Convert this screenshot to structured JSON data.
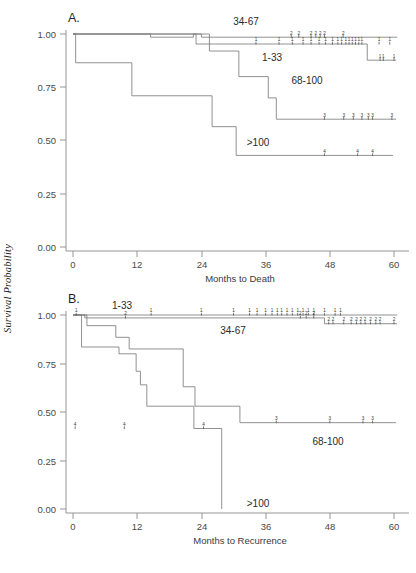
{
  "figure": {
    "ylabel": "Survival Probability",
    "background": "#ffffff",
    "curve_color": "#7d7d7d",
    "axis_color": "#8a8a8a",
    "text_color": "#333333"
  },
  "panels": [
    {
      "letter": "A.",
      "xlabel": "Months to Death",
      "ylabel": "Survival Probability",
      "xticks": [
        "0",
        "12",
        "24",
        "36",
        "48",
        "60"
      ],
      "yticks": [
        "1.00",
        "0.75",
        "0.50",
        "0.25",
        "0.00"
      ],
      "labels": [
        {
          "text": "34-67",
          "x": 246,
          "y": 21
        },
        {
          "text": "1-33",
          "x": 270,
          "y": 57
        },
        {
          "text": "68-100",
          "x": 303,
          "y": 80
        },
        {
          "text": ">100",
          "x": 256,
          "y": 142
        }
      ]
    },
    {
      "letter": "B.",
      "xlabel": "Months to Recurrence",
      "ylabel": "Survival Probability",
      "xticks": [
        "0",
        "12",
        "24",
        "36",
        "48",
        "60"
      ],
      "yticks": [
        "1.00",
        "0.75",
        "0.50",
        "0.25",
        "0.00"
      ],
      "labels": [
        {
          "text": "1-33",
          "x": 120,
          "y": 305
        },
        {
          "text": "34-67",
          "x": 231,
          "y": 330
        },
        {
          "text": "68-100",
          "x": 326,
          "y": 441
        },
        {
          "text": ">100",
          "x": 256,
          "y": 503
        }
      ]
    }
  ],
  "chart_data": {
    "type": "line",
    "subtype": "kaplan-meier-survival",
    "title": "",
    "ylabel": "Survival Probability",
    "ylim": [
      0.0,
      1.0
    ],
    "xlim": [
      0,
      61
    ],
    "grid": false,
    "legend": "inline-curve-labels",
    "panels": [
      {
        "label": "A.",
        "xlabel": "Months to Death",
        "xlim": [
          0,
          61
        ],
        "xticks": [
          0,
          12,
          24,
          36,
          48,
          60
        ],
        "yticks": [
          0.0,
          0.25,
          0.5,
          0.75,
          1.0
        ],
        "series": [
          {
            "name": "1-33",
            "group_code": "1",
            "steps": [
              [
                0,
                1.0
              ],
              [
                23.0,
                1.0
              ],
              [
                23.0,
                0.953
              ],
              [
                55.0,
                0.953
              ],
              [
                55.0,
                0.877
              ],
              [
                60.4,
                0.877
              ]
            ],
            "censor_times": [
              34.2,
              38.5,
              41.0,
              43.0,
              44.5,
              46.0,
              47.2,
              48.5,
              49.5,
              50.2,
              51.0,
              51.6,
              52.2,
              52.8,
              53.4,
              54.0,
              57.2,
              59.2
            ],
            "censor_level": 0.953,
            "censor_times_after": [
              57.4,
              58.0,
              60.0
            ],
            "censor_level_after": 0.877
          },
          {
            "name": "34-67",
            "group_code": "2",
            "steps": [
              [
                0,
                1.0
              ],
              [
                14.5,
                1.0
              ],
              [
                14.5,
                0.985
              ],
              [
                22.5,
                0.985
              ],
              [
                22.5,
                1.0
              ],
              [
                24.0,
                1.0
              ],
              [
                24.0,
                0.985
              ],
              [
                60.6,
                0.985
              ]
            ],
            "censor_times": [
              40.8,
              42.2,
              44.5,
              45.4,
              46.2,
              47.0,
              50.5
            ],
            "censor_level": 0.985
          },
          {
            "name": "68-100",
            "group_code": "3",
            "steps": [
              [
                0,
                1.0
              ],
              [
                25.5,
                1.0
              ],
              [
                25.5,
                0.92
              ],
              [
                31.0,
                0.92
              ],
              [
                31.0,
                0.8
              ],
              [
                36.5,
                0.8
              ],
              [
                36.5,
                0.7
              ],
              [
                38.0,
                0.7
              ],
              [
                38.0,
                0.6
              ],
              [
                60.4,
                0.6
              ]
            ],
            "censor_times": [
              47.0,
              50.6,
              52.4,
              54.0,
              55.2,
              56.0,
              59.6
            ],
            "censor_level": 0.6
          },
          {
            "name": ">100",
            "group_code": "4",
            "steps": [
              [
                0,
                1.0
              ],
              [
                0.5,
                1.0
              ],
              [
                0.5,
                0.865
              ],
              [
                11.0,
                0.865
              ],
              [
                11.0,
                0.71
              ],
              [
                26.0,
                0.71
              ],
              [
                26.0,
                0.565
              ],
              [
                30.5,
                0.565
              ],
              [
                30.5,
                0.43
              ],
              [
                59.8,
                0.43
              ]
            ],
            "censor_times": [
              47.0,
              53.2,
              56.0
            ],
            "censor_level": 0.43
          }
        ]
      },
      {
        "label": "B.",
        "xlabel": "Months to Recurrence",
        "xlim": [
          0,
          61
        ],
        "xticks": [
          0,
          12,
          24,
          36,
          48,
          60
        ],
        "yticks": [
          0.0,
          0.25,
          0.5,
          0.75,
          1.0
        ],
        "series": [
          {
            "name": "1-33",
            "group_code": "1",
            "steps": [
              [
                0,
                1.0
              ],
              [
                60.6,
                1.0
              ]
            ],
            "censor_times": [
              0.6,
              14.6,
              24.0,
              30.0,
              33.0,
              34.4,
              36.0,
              37.2,
              38.2,
              39.0,
              40.0,
              41.0,
              42.0,
              43.0,
              44.0,
              45.0,
              47.0,
              49.0,
              50.0
            ],
            "censor_level": 1.0
          },
          {
            "name": "34-67",
            "group_code": "2",
            "steps": [
              [
                0,
                1.0
              ],
              [
                2.2,
                1.0
              ],
              [
                2.2,
                0.985
              ],
              [
                47.0,
                0.985
              ],
              [
                47.0,
                0.955
              ],
              [
                60.6,
                0.955
              ]
            ],
            "censor_times": [
              9.8,
              42.5,
              43.6,
              45.0
            ],
            "censor_level": 0.985,
            "censor_times_after": [
              47.8,
              48.6,
              50.6,
              52.0,
              53.0,
              53.8,
              54.6,
              55.6,
              56.6,
              57.4,
              60.0
            ],
            "censor_level_after": 0.955
          },
          {
            "name": "68-100",
            "group_code": "3",
            "steps": [
              [
                0,
                1.0
              ],
              [
                2.6,
                1.0
              ],
              [
                2.6,
                0.945
              ],
              [
                8.0,
                0.945
              ],
              [
                8.0,
                0.885
              ],
              [
                10.5,
                0.885
              ],
              [
                10.5,
                0.825
              ],
              [
                20.6,
                0.825
              ],
              [
                20.6,
                0.63
              ],
              [
                22.8,
                0.63
              ],
              [
                22.8,
                0.53
              ],
              [
                31.2,
                0.53
              ],
              [
                31.2,
                0.445
              ],
              [
                60.4,
                0.445
              ]
            ],
            "censor_times": [
              10.8,
              20.0,
              24.2
            ],
            "censor_level_group": "mixed",
            "censor_times_after": [
              38.0,
              48.0,
              54.2,
              56.0
            ],
            "censor_level_after": 0.445
          },
          {
            "name": ">100",
            "group_code": "4",
            "steps": [
              [
                0,
                1.0
              ],
              [
                1.6,
                1.0
              ],
              [
                1.6,
                0.835
              ],
              [
                8.6,
                0.835
              ],
              [
                8.6,
                0.8
              ],
              [
                11.8,
                0.8
              ],
              [
                11.8,
                0.71
              ],
              [
                12.6,
                0.71
              ],
              [
                12.6,
                0.64
              ],
              [
                13.8,
                0.64
              ],
              [
                13.8,
                0.53
              ],
              [
                22.6,
                0.53
              ],
              [
                22.6,
                0.415
              ],
              [
                27.8,
                0.415
              ],
              [
                27.8,
                0.0
              ]
            ],
            "censor_times": [
              0.4,
              9.6,
              24.4
            ],
            "censor_level": 0.415
          }
        ]
      }
    ]
  }
}
